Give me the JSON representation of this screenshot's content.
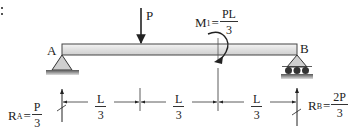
{
  "corner_mark": ":",
  "beam": {
    "left_label": "A",
    "right_label": "B"
  },
  "load": {
    "label": "P"
  },
  "moment": {
    "symbol": "M",
    "subscript": "1",
    "equals": "=",
    "numerator": "PL",
    "denominator": "3"
  },
  "reaction_a": {
    "symbol": "R",
    "subscript": "A",
    "equals": "=",
    "numerator": "P",
    "denominator": "3"
  },
  "reaction_b": {
    "symbol": "R",
    "subscript": "B",
    "equals": "=",
    "numerator": "2P",
    "denominator": "3"
  },
  "dimensions": [
    {
      "numerator": "L",
      "denominator": "3"
    },
    {
      "numerator": "L",
      "denominator": "3"
    },
    {
      "numerator": "L",
      "denominator": "3"
    }
  ],
  "colors": {
    "beam_fill": "#e6e6e6",
    "beam_stroke": "#444444",
    "support_fill": "#c8c8c8",
    "line": "#333333"
  }
}
